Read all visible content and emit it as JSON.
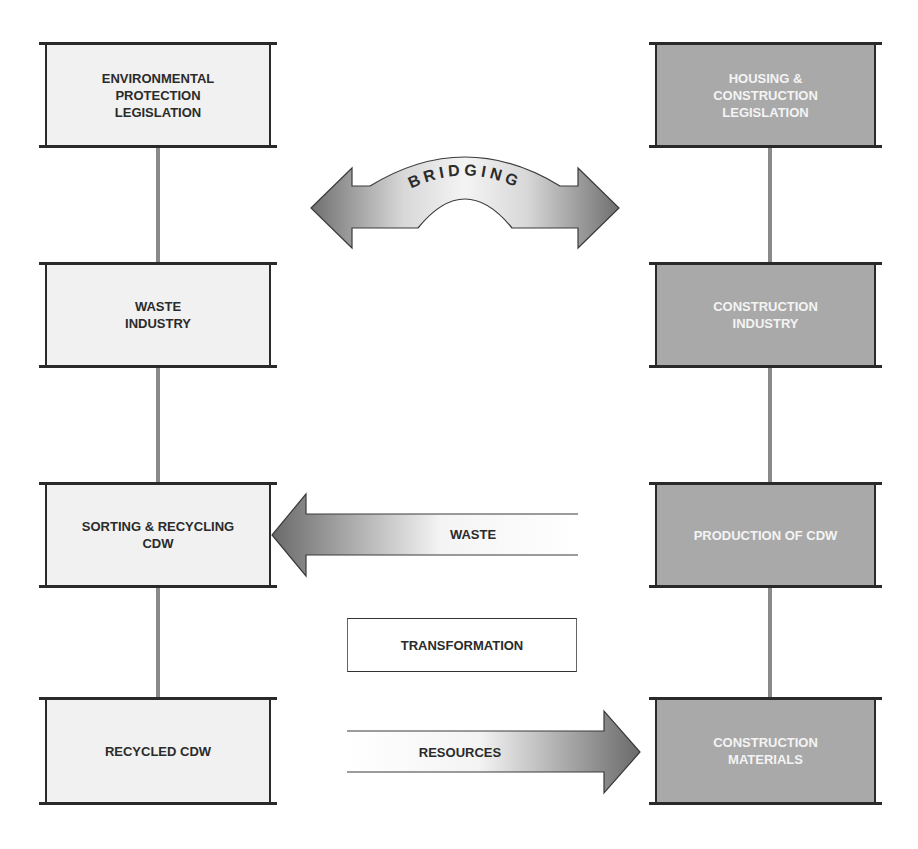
{
  "diagram": {
    "left_column": [
      {
        "id": "env-legislation",
        "label": "ENVIRONMENTAL\nPROTECTION\nLEGISLATION"
      },
      {
        "id": "waste-industry",
        "label": "WASTE\nINDUSTRY"
      },
      {
        "id": "sorting-recycling",
        "label": "SORTING & RECYCLING\nCDW"
      },
      {
        "id": "recycled-cdw",
        "label": "RECYCLED CDW"
      }
    ],
    "right_column": [
      {
        "id": "housing-legislation",
        "label": "HOUSING &\nCONSTRUCTION\nLEGISLATION"
      },
      {
        "id": "construction-industry",
        "label": "CONSTRUCTION\nINDUSTRY"
      },
      {
        "id": "production-cdw",
        "label": "PRODUCTION OF CDW"
      },
      {
        "id": "construction-materials",
        "label": "CONSTRUCTION\nMATERIALS"
      }
    ],
    "arrows": {
      "bridging": {
        "label": "BRIDGING",
        "direction": "both"
      },
      "waste": {
        "label": "WASTE",
        "direction": "left"
      },
      "transformation": {
        "label": "TRANSFORMATION"
      },
      "resources": {
        "label": "RESOURCES",
        "direction": "right"
      }
    },
    "colors": {
      "left_fill": "#f1f1f1",
      "right_fill": "#a9a9a9",
      "outline": "#2a2a2a",
      "connector": "#8a8a8a"
    }
  }
}
